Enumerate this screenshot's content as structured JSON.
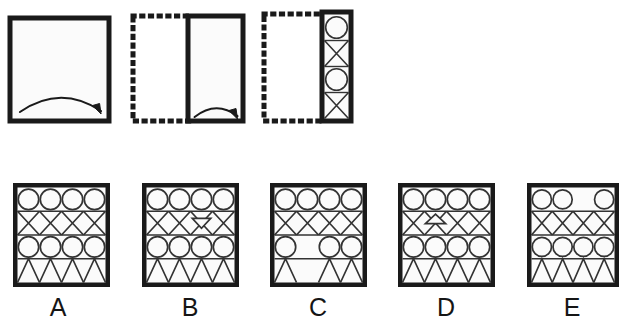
{
  "puzzle": {
    "type": "paper-folding-punch",
    "title": "",
    "steps_count": 3,
    "options_count": 5
  },
  "colors": {
    "ink": "#1a1a1a",
    "paper": "#fbfbfb",
    "background": "#ffffff",
    "thin_line": "#333333"
  },
  "steps": [
    {
      "id": "step-1",
      "name": "unfolded-square",
      "border": "solid",
      "shape": "square",
      "x": 10,
      "y": 18,
      "w": 99,
      "h": 103,
      "arrow": {
        "name": "fold-arrow-right",
        "direction": "right",
        "span": "wide"
      },
      "contents": []
    },
    {
      "id": "step-2",
      "name": "folded-once",
      "ghost": {
        "border": "dotted",
        "x": 133,
        "y": 16,
        "w": 58,
        "h": 105
      },
      "border": "solid",
      "shape": "rect",
      "x": 188,
      "y": 16,
      "w": 55,
      "h": 105,
      "arrow": {
        "name": "fold-arrow-right",
        "direction": "right",
        "span": "narrow"
      },
      "contents": []
    },
    {
      "id": "step-3",
      "name": "folded-twice-punched",
      "ghost": {
        "border": "dotted",
        "x": 264,
        "y": 14,
        "w": 61,
        "h": 107
      },
      "border": "solid",
      "shape": "rect",
      "x": 322,
      "y": 12,
      "w": 29,
      "h": 109,
      "arrow": null,
      "contents": [
        "circle",
        "hourglass",
        "circle",
        "hourglass"
      ]
    }
  ],
  "options": [
    {
      "id": "option-a",
      "label": "A",
      "x": 13,
      "y": 183,
      "w": 97,
      "h": 104,
      "label_x": 38,
      "label_y": 295,
      "rows": [
        {
          "type": "circles",
          "cells": [
            1,
            1,
            1,
            1
          ]
        },
        {
          "type": "xband",
          "cells": [
            1,
            1,
            1,
            1
          ],
          "extra": null
        },
        {
          "type": "circles",
          "cells": [
            1,
            1,
            1,
            1
          ]
        },
        {
          "type": "zigzag",
          "cells": [
            1,
            1,
            1,
            1
          ]
        }
      ]
    },
    {
      "id": "option-b",
      "label": "B",
      "x": 142,
      "y": 183,
      "w": 97,
      "h": 104,
      "label_x": 170,
      "label_y": 295,
      "rows": [
        {
          "type": "circles",
          "cells": [
            1,
            1,
            1,
            1
          ]
        },
        {
          "type": "xband",
          "cells": [
            1,
            1,
            1,
            1
          ],
          "extra": {
            "shape": "triangle-down-small",
            "col": 2
          }
        },
        {
          "type": "circles",
          "cells": [
            1,
            1,
            1,
            1
          ]
        },
        {
          "type": "zigzag",
          "cells": [
            1,
            1,
            1,
            1
          ]
        }
      ]
    },
    {
      "id": "option-c",
      "label": "C",
      "x": 270,
      "y": 183,
      "w": 97,
      "h": 104,
      "label_x": 298,
      "label_y": 295,
      "rows": [
        {
          "type": "circles",
          "cells": [
            1,
            1,
            1,
            1
          ]
        },
        {
          "type": "xband",
          "cells": [
            1,
            1,
            1,
            1
          ],
          "extra": null
        },
        {
          "type": "circles",
          "cells": [
            1,
            0,
            1,
            1
          ]
        },
        {
          "type": "zigzag",
          "cells": [
            1,
            0,
            1,
            1
          ]
        }
      ]
    },
    {
      "id": "option-d",
      "label": "D",
      "x": 398,
      "y": 183,
      "w": 97,
      "h": 104,
      "label_x": 426,
      "label_y": 295,
      "rows": [
        {
          "type": "circles",
          "cells": [
            1,
            1,
            1,
            1
          ]
        },
        {
          "type": "xband",
          "cells": [
            1,
            1,
            1,
            1
          ],
          "extra": {
            "shape": "triangle-up-small",
            "col": 1
          }
        },
        {
          "type": "circles",
          "cells": [
            1,
            1,
            1,
            1
          ]
        },
        {
          "type": "zigzag",
          "cells": [
            1,
            1,
            1,
            1
          ]
        }
      ]
    },
    {
      "id": "option-e",
      "label": "E",
      "x": 527,
      "y": 183,
      "w": 92,
      "h": 104,
      "label_x": 552,
      "label_y": 295,
      "rows": [
        {
          "type": "circles",
          "cells": [
            1,
            1,
            0,
            1
          ]
        },
        {
          "type": "xband",
          "cells": [
            1,
            1,
            1,
            1
          ],
          "extra": null
        },
        {
          "type": "circles",
          "cells": [
            1,
            1,
            1,
            1
          ]
        },
        {
          "type": "zigzag",
          "cells": [
            1,
            1,
            1,
            1
          ]
        }
      ]
    }
  ]
}
